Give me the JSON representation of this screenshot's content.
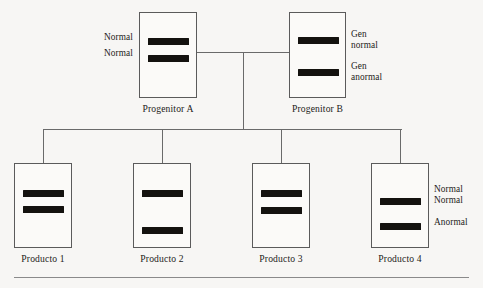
{
  "diagram": {
    "type": "pedigree-inheritance-diagram",
    "colors": {
      "background": "#f7f6f4",
      "box_stroke": "#5b5b5b",
      "band_fill": "#14120f",
      "connector": "#6a6a6a",
      "text": "#1d1b19",
      "rule": "#8a8a8a"
    },
    "parents": [
      {
        "id": "progenitor-a",
        "caption": "Progenitor  A",
        "label_side": "left",
        "labels": [
          "Normal",
          "Normal"
        ],
        "bands": [
          {
            "name": "band-normal-upper",
            "state": "normal"
          },
          {
            "name": "band-normal-lower",
            "state": "normal"
          }
        ]
      },
      {
        "id": "progenitor-b",
        "caption": "Progenitor  B",
        "label_side": "right",
        "labels": [
          "Gen\nnormal",
          "Gen\nanormal"
        ],
        "label_lines": [
          [
            "Gen",
            "normal"
          ],
          [
            "Gen",
            "anormal"
          ]
        ],
        "bands": [
          {
            "name": "band-gen-normal",
            "state": "normal"
          },
          {
            "name": "band-gen-anormal",
            "state": "abnormal"
          }
        ]
      }
    ],
    "offspring": [
      {
        "id": "producto-1",
        "caption": "Producto  1",
        "labels": [],
        "bands": [
          {
            "name": "band-upper",
            "state": "normal"
          },
          {
            "name": "band-lower",
            "state": "normal"
          }
        ]
      },
      {
        "id": "producto-2",
        "caption": "Producto  2",
        "labels": [],
        "bands": [
          {
            "name": "band-upper",
            "state": "normal"
          },
          {
            "name": "band-lower",
            "state": "normal"
          }
        ]
      },
      {
        "id": "producto-3",
        "caption": "Producto  3",
        "labels": [],
        "bands": [
          {
            "name": "band-upper",
            "state": "normal"
          },
          {
            "name": "band-lower",
            "state": "abnormal"
          }
        ]
      },
      {
        "id": "producto-4",
        "caption": "Producto  4",
        "label_side": "right",
        "labels": [
          "Normal",
          "Normal",
          "Anormal"
        ],
        "label_lines": [
          [
            "Normal",
            "Normal"
          ],
          [
            "Anormal"
          ]
        ],
        "bands": [
          {
            "name": "band-upper",
            "state": "normal"
          },
          {
            "name": "band-lower",
            "state": "abnormal"
          }
        ]
      }
    ],
    "labels": {
      "progenitor_a_left_1": "Normal",
      "progenitor_a_left_2": "Normal",
      "progenitor_b_right_1a": "Gen",
      "progenitor_b_right_1b": "normal",
      "progenitor_b_right_2a": "Gen",
      "progenitor_b_right_2b": "anormal",
      "producto4_right_1a": "Normal",
      "producto4_right_1b": "Normal",
      "producto4_right_2": "Anormal",
      "caption_progenitor_a": "Progenitor  A",
      "caption_progenitor_b": "Progenitor  B",
      "caption_producto_1": "Producto  1",
      "caption_producto_2": "Producto  2",
      "caption_producto_3": "Producto  3",
      "caption_producto_4": "Producto  4"
    }
  }
}
